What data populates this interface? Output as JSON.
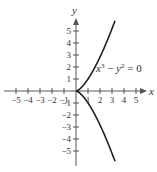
{
  "chart_data": {
    "type": "line",
    "title": "",
    "equation_label": "x³ − y² = 0",
    "equation_parts": {
      "x": "x",
      "exp3": "3",
      "minus": " − ",
      "y": "y",
      "exp2": "2",
      "rest": " = 0"
    },
    "xlabel": "x",
    "ylabel": "y",
    "xlim": [
      -5.5,
      6
    ],
    "ylim": [
      -6,
      6.5
    ],
    "grid": false,
    "legend": "none",
    "x_ticks": [
      -5,
      -4,
      -3,
      -2,
      -1,
      1,
      2,
      3,
      4,
      5
    ],
    "x_tick_labels": [
      "−5",
      "−4",
      "−3",
      "−2",
      "−1",
      "1",
      "2",
      "3",
      "4",
      "5"
    ],
    "y_ticks": [
      5,
      4,
      3,
      2,
      1,
      -1,
      -2,
      -3,
      -4,
      -5
    ],
    "y_tick_labels": [
      "5",
      "4",
      "3",
      "2",
      "1",
      "−1",
      "−2",
      "−3",
      "−4",
      "−5"
    ],
    "series": [
      {
        "name": "upper branch y = x^(3/2)",
        "x": [
          0,
          0.5,
          1,
          1.5,
          2,
          2.5,
          3,
          3.25
        ],
        "y": [
          0,
          0.354,
          1,
          1.837,
          2.828,
          3.953,
          5.196,
          5.859
        ]
      },
      {
        "name": "lower branch y = -x^(3/2)",
        "x": [
          0,
          0.5,
          1,
          1.5,
          2,
          2.5,
          3,
          3.25
        ],
        "y": [
          0,
          -0.354,
          -1,
          -1.837,
          -2.828,
          -3.953,
          -5.196,
          -5.859
        ]
      }
    ],
    "colors": {
      "axis": "#555555",
      "curve": "#222222",
      "text": "#333333"
    }
  }
}
